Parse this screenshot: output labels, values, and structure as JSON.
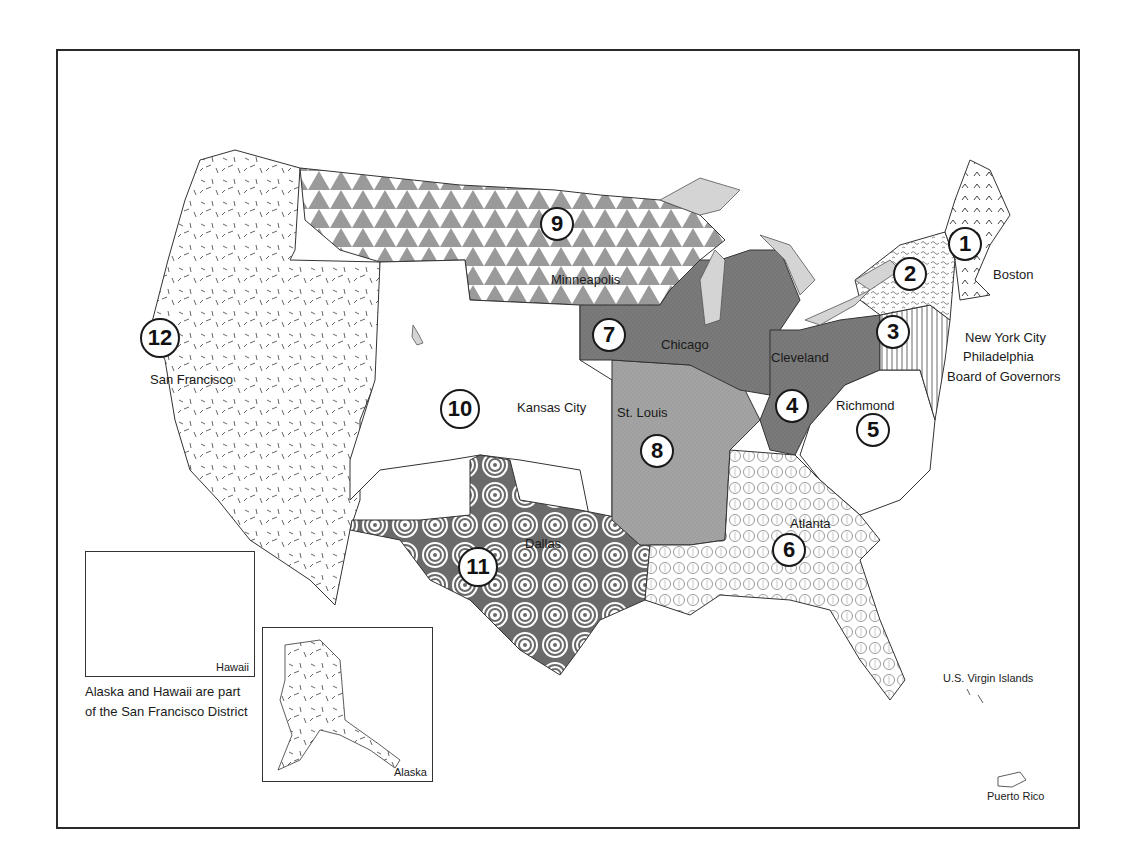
{
  "map": {
    "title": "Federal Reserve Districts",
    "districts": [
      {
        "number": "1",
        "city": "Boston",
        "pattern": "chevron-hatch",
        "color": "#ffffff"
      },
      {
        "number": "2",
        "city": "New York City",
        "pattern": "scribble",
        "color": "#ffffff"
      },
      {
        "number": "3",
        "city": "Philadelphia",
        "pattern": "vertical-lines",
        "color": "#ffffff"
      },
      {
        "number": "4",
        "city": "Cleveland",
        "pattern": "solid-dark-gray",
        "color": "#7a7a7a"
      },
      {
        "number": "5",
        "city": "Richmond",
        "pattern": "none",
        "color": "#ffffff"
      },
      {
        "number": "6",
        "city": "Atlanta",
        "pattern": "circles",
        "color": "#ffffff"
      },
      {
        "number": "7",
        "city": "Chicago",
        "pattern": "solid-dark-gray",
        "color": "#7a7a7a"
      },
      {
        "number": "8",
        "city": "St. Louis",
        "pattern": "solid-medium-gray",
        "color": "#a0a0a0"
      },
      {
        "number": "9",
        "city": "Minneapolis",
        "pattern": "triangles",
        "color": "#9a9a9a"
      },
      {
        "number": "10",
        "city": "Kansas City",
        "pattern": "none",
        "color": "#ffffff"
      },
      {
        "number": "11",
        "city": "Dallas",
        "pattern": "spirals",
        "color": "#555555"
      },
      {
        "number": "12",
        "city": "San Francisco",
        "pattern": "dashes",
        "color": "#ffffff"
      }
    ],
    "extra_labels": {
      "board": "Board of Governors",
      "virgin_islands": "U.S. Virgin Islands",
      "puerto_rico": "Puerto Rico"
    },
    "insets": {
      "hawaii": "Hawaii",
      "alaska": "Alaska",
      "note_line1": "Alaska and Hawaii are part",
      "note_line2": "of the San Francisco District"
    },
    "colors": {
      "border": "#2a2a2a",
      "lakes": "#d4d4d4",
      "dark_region": "#7a7a7a",
      "medium_region": "#a0a0a0"
    }
  }
}
